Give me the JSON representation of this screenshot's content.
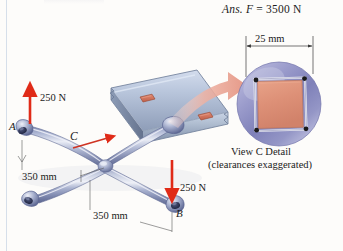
{
  "figure": {
    "answer_line": {
      "prefix": "Ans.",
      "symbol": "F",
      "equals": "=",
      "value": "3500 N"
    },
    "labels": {
      "point_a": "A",
      "point_b": "B",
      "point_c": "C",
      "force_a": "250 N",
      "force_b": "250 N",
      "dim_arm_upper": "350 mm",
      "dim_arm_lower": "350 mm"
    },
    "detail": {
      "dimension": "25 mm",
      "caption_line1": "View C Detail",
      "caption_line2": "(clearances exaggerated)"
    },
    "colors": {
      "force_arrow": "#e02b18",
      "callout_arrow": "#e8a193",
      "wrench_body": "#9aa4c6",
      "wrench_highlight": "#e3e7f3",
      "plate_body": "#aebfd2",
      "socket_fill": "#d4705c",
      "detail_disc": "#8d90c4",
      "detail_square": "#dd9077",
      "page_rule": "#cfd9e6",
      "text": "#1b1b1b"
    }
  }
}
